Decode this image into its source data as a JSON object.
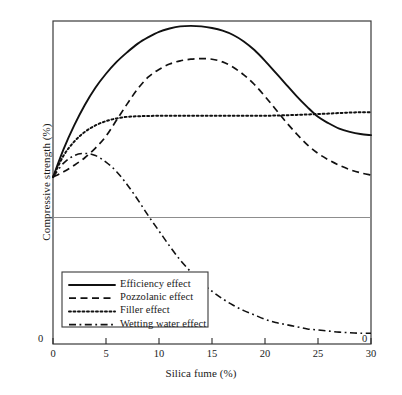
{
  "chart_data": {
    "type": "line",
    "title": "",
    "xlabel": "Silica fume (%)",
    "ylabel": "Compressive strength (%)",
    "xlim": [
      0,
      30
    ],
    "ylim": [
      -1.55,
      1.45
    ],
    "xticks": [
      "0",
      "5",
      "10",
      "15",
      "20",
      "25",
      "30"
    ],
    "xtick_values": [
      0,
      5,
      10,
      15,
      20,
      25,
      30
    ],
    "y_origin_label": "0",
    "x_origin_label": "0",
    "x_end_zero_label": "0",
    "grid": false,
    "zero_baseline": true,
    "legend_position": "lower-left",
    "series": [
      {
        "name": "Efficiency effect",
        "style": "solid",
        "color": "#111111",
        "x": [
          0,
          1,
          2,
          3,
          4,
          5,
          6,
          7,
          8,
          9,
          10,
          11,
          12,
          13,
          14,
          15,
          16,
          17,
          18,
          19,
          20,
          21,
          22,
          23,
          24,
          25,
          26,
          27,
          28,
          29,
          30
        ],
        "y": [
          0.0,
          0.26,
          0.48,
          0.67,
          0.83,
          0.96,
          1.07,
          1.16,
          1.24,
          1.3,
          1.35,
          1.38,
          1.4,
          1.405,
          1.4,
          1.385,
          1.36,
          1.32,
          1.26,
          1.18,
          1.08,
          0.97,
          0.86,
          0.75,
          0.65,
          0.56,
          0.5,
          0.45,
          0.42,
          0.4,
          0.39
        ]
      },
      {
        "name": "Pozzolanic effect",
        "style": "dashed",
        "color": "#111111",
        "x": [
          0,
          1,
          2,
          3,
          4,
          5,
          6,
          7,
          8,
          9,
          10,
          11,
          12,
          13,
          14,
          15,
          16,
          17,
          18,
          19,
          20,
          21,
          22,
          23,
          24,
          25,
          26,
          27,
          28,
          29,
          30
        ],
        "y": [
          0.0,
          0.05,
          0.11,
          0.18,
          0.27,
          0.38,
          0.53,
          0.68,
          0.82,
          0.93,
          1.0,
          1.05,
          1.08,
          1.095,
          1.1,
          1.095,
          1.07,
          1.02,
          0.95,
          0.86,
          0.75,
          0.63,
          0.51,
          0.4,
          0.3,
          0.22,
          0.16,
          0.11,
          0.07,
          0.04,
          0.02
        ]
      },
      {
        "name": "Filler effect",
        "style": "dotted",
        "color": "#111111",
        "x": [
          0,
          1,
          2,
          3,
          4,
          5,
          6,
          7,
          8,
          9,
          10,
          11,
          12,
          13,
          14,
          15,
          16,
          17,
          18,
          19,
          20,
          21,
          22,
          23,
          24,
          25,
          26,
          27,
          28,
          29,
          30
        ],
        "y": [
          0.0,
          0.2,
          0.33,
          0.42,
          0.48,
          0.52,
          0.545,
          0.56,
          0.565,
          0.568,
          0.57,
          0.57,
          0.57,
          0.57,
          0.57,
          0.57,
          0.57,
          0.57,
          0.57,
          0.57,
          0.57,
          0.572,
          0.575,
          0.578,
          0.582,
          0.586,
          0.59,
          0.595,
          0.6,
          0.602,
          0.603
        ]
      },
      {
        "name": "Wetting water effect",
        "style": "dashdot",
        "color": "#111111",
        "x": [
          0,
          1,
          2,
          3,
          4,
          5,
          6,
          7,
          8,
          9,
          10,
          11,
          12,
          13,
          14,
          15,
          16,
          17,
          18,
          19,
          20,
          21,
          22,
          23,
          24,
          25,
          26,
          27,
          28,
          29,
          30
        ],
        "y": [
          0.0,
          0.13,
          0.2,
          0.22,
          0.2,
          0.14,
          0.05,
          -0.07,
          -0.21,
          -0.36,
          -0.5,
          -0.64,
          -0.77,
          -0.88,
          -0.98,
          -1.06,
          -1.13,
          -1.19,
          -1.24,
          -1.28,
          -1.32,
          -1.35,
          -1.37,
          -1.39,
          -1.41,
          -1.42,
          -1.43,
          -1.44,
          -1.445,
          -1.45,
          -1.45
        ]
      }
    ]
  },
  "legend": {
    "items": [
      {
        "label": "Efficiency effect"
      },
      {
        "label": "Pozzolanic effect"
      },
      {
        "label": "Filler effect"
      },
      {
        "label": "Wetting water effect"
      }
    ]
  }
}
